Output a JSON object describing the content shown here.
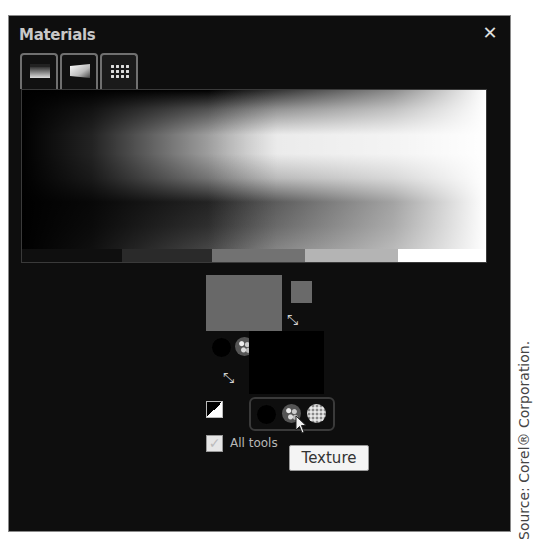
{
  "panel": {
    "title": "Materials",
    "close_icon": "close-icon",
    "close_glyph": "✕"
  },
  "tabs": [
    {
      "name": "Frame",
      "icon": "frame-tab-icon",
      "active": false
    },
    {
      "name": "Rainbow",
      "icon": "rainbow-tab-icon",
      "active": false
    },
    {
      "name": "Swatches",
      "icon": "swatches-tab-icon",
      "active": true
    }
  ],
  "picker": {
    "type": "grayscale spectrum",
    "swatches": [
      {
        "color": "#0f0f0f",
        "width": 100
      },
      {
        "color": "#2a2a2a",
        "width": 90
      },
      {
        "color": "#727272",
        "width": 93
      },
      {
        "color": "#b4b4b4",
        "width": 93
      },
      {
        "color": "#ffffff",
        "width": 88
      }
    ]
  },
  "properties": {
    "stroke_color": "#686868",
    "fill_color": "#000000",
    "foreground_mini": "#6a6a6a",
    "swap_glyph": "⤡"
  },
  "fill_styles": {
    "items": [
      {
        "name": "Color",
        "icon": "color-style-icon"
      },
      {
        "name": "Texture",
        "icon": "texture-style-icon"
      },
      {
        "name": "Pattern",
        "icon": "pattern-style-icon"
      }
    ]
  },
  "all_tools": {
    "label": "All tools",
    "checked": true,
    "check_glyph": "✓"
  },
  "tooltip": {
    "text": "Texture"
  },
  "caption": {
    "source": "Source: Corel® Corporation."
  }
}
